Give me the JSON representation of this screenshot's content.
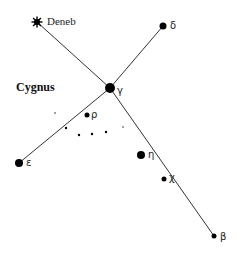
{
  "diagram": {
    "title": "Cygnus",
    "colors": {
      "line": "#333333",
      "star": "#000000",
      "text": "#222222"
    },
    "stars": [
      {
        "id": "deneb",
        "label": "Deneb",
        "x": 37,
        "y": 22,
        "r": 4,
        "shape": "burst"
      },
      {
        "id": "delta",
        "label": "δ",
        "x": 163,
        "y": 26,
        "r": 3.5,
        "shape": "dot"
      },
      {
        "id": "gamma",
        "label": "γ",
        "x": 110,
        "y": 88,
        "r": 5,
        "shape": "dot"
      },
      {
        "id": "epsilon",
        "label": "ε",
        "x": 19,
        "y": 163,
        "r": 4,
        "shape": "dot"
      },
      {
        "id": "rho",
        "label": "ρ",
        "x": 87,
        "y": 115,
        "r": 2.5,
        "shape": "dot"
      },
      {
        "id": "eta",
        "label": "η",
        "x": 141,
        "y": 155,
        "r": 4,
        "shape": "dot"
      },
      {
        "id": "chi",
        "label": "χ",
        "x": 164,
        "y": 179,
        "r": 2.5,
        "shape": "dot"
      },
      {
        "id": "beta",
        "label": "β",
        "x": 214,
        "y": 236,
        "r": 2.5,
        "shape": "dot"
      }
    ],
    "minor_stars": [
      {
        "x": 66,
        "y": 128,
        "r": 1.2
      },
      {
        "x": 79,
        "y": 135,
        "r": 1.2
      },
      {
        "x": 92,
        "y": 134,
        "r": 1.2
      },
      {
        "x": 106,
        "y": 132,
        "r": 1.2
      },
      {
        "x": 55,
        "y": 113,
        "r": 0.7
      },
      {
        "x": 123,
        "y": 127,
        "r": 0.7
      }
    ],
    "lines": [
      {
        "from": "deneb",
        "to": "gamma"
      },
      {
        "from": "gamma",
        "to": "beta"
      },
      {
        "from": "delta",
        "to": "gamma"
      },
      {
        "from": "gamma",
        "to": "epsilon"
      }
    ]
  }
}
